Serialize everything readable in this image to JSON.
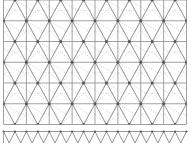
{
  "figure": {
    "kind": "triangular-lattice-pattern",
    "main_panel": {
      "name": "lattice-panel",
      "columns": 8,
      "rows": 6,
      "features": [
        "vertical-lines",
        "horizontal-lines",
        "diagonal-lines",
        "dotted-subdivision-lines",
        "node-dots"
      ]
    },
    "border_strip": {
      "name": "zigzag-border",
      "repeats": 16,
      "features": [
        "top-line",
        "zigzag-triangles"
      ]
    }
  },
  "colors": {
    "background": "#ffffff",
    "line": "#8a8a8a",
    "line_strong": "#6e6e6e",
    "dotted": "#b4b4b4",
    "node": "#555555"
  }
}
